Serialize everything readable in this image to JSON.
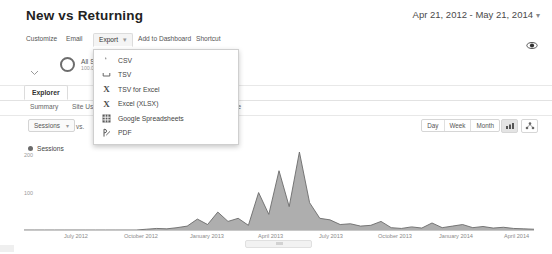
{
  "header": {
    "title": "New vs Returning",
    "date_range": "Apr 21, 2012 - May 21, 2014",
    "date_range_caret": "▾"
  },
  "toolbar": {
    "items": [
      {
        "label": "Customize",
        "active": false
      },
      {
        "label": "Email",
        "active": false
      },
      {
        "label": "Export",
        "active": true
      },
      {
        "label": "Add to Dashboard",
        "active": false
      },
      {
        "label": "Shortcut",
        "active": false
      }
    ],
    "export_caret": "▾",
    "share_icon": "share-icon"
  },
  "export_menu": {
    "items": [
      {
        "label": "CSV",
        "icon": "csv-file-icon"
      },
      {
        "label": "TSV",
        "icon": "tsv-file-icon"
      },
      {
        "label": "TSV for Excel",
        "icon": "excel-x-icon"
      },
      {
        "label": "Excel (XLSX)",
        "icon": "excel-x-icon"
      },
      {
        "label": "Google Spreadsheets",
        "icon": "grid-sheets-icon"
      },
      {
        "label": "PDF",
        "icon": "pdf-icon"
      }
    ]
  },
  "segment": {
    "chevron": "⌄",
    "name": "All Sessions",
    "percent": "100.00%"
  },
  "explorer": {
    "tab_label": "Explorer"
  },
  "subtabs": [
    {
      "label": "Summary"
    },
    {
      "label": "Site Usage"
    },
    {
      "label": "Ecommerce"
    }
  ],
  "metric_row": {
    "metric_select": "Sessions",
    "select_caret": "▾",
    "vs_label": "vs.",
    "granularity": [
      "Day",
      "Week",
      "Month"
    ],
    "view_buttons": [
      {
        "icon": "bar-chart-icon",
        "selected": true
      },
      {
        "icon": "scatter-plot-icon",
        "selected": false
      }
    ]
  },
  "legend": {
    "series_label": "Sessions",
    "color": "#6b6b6b"
  },
  "chart_data": {
    "type": "area",
    "xlabel": "",
    "ylabel": "Sessions",
    "ylim": [
      0,
      200
    ],
    "yticks": [
      100,
      200
    ],
    "grid": false,
    "legend_position": "top-left",
    "tick_labels": [
      "July 2012",
      "October 2012",
      "January 2013",
      "April 2013",
      "July 2013",
      "October 2013",
      "January 2014",
      "April 2014"
    ],
    "series": [
      {
        "name": "Sessions",
        "color": "#6b6b6b",
        "x": [
          "2012-04-21",
          "2012-05-21",
          "2012-06-21",
          "2012-07-21",
          "2012-08-21",
          "2012-09-21",
          "2012-10-21",
          "2012-11-21",
          "2012-12-21",
          "2013-01-21",
          "2013-02-21",
          "2013-03-21",
          "2013-04-21",
          "2013-05-01",
          "2013-05-11",
          "2013-05-21",
          "2013-06-01",
          "2013-06-08",
          "2013-06-15",
          "2013-06-22",
          "2013-06-29",
          "2013-07-03",
          "2013-07-06",
          "2013-07-10",
          "2013-07-13",
          "2013-07-17",
          "2013-07-20",
          "2013-07-24",
          "2013-07-28",
          "2013-08-04",
          "2013-08-11",
          "2013-08-18",
          "2013-08-25",
          "2013-09-08",
          "2013-09-22",
          "2013-10-06",
          "2013-10-20",
          "2013-11-10",
          "2013-11-24",
          "2013-12-15",
          "2014-01-05",
          "2014-01-19",
          "2014-02-02",
          "2014-02-16",
          "2014-03-02",
          "2014-03-16",
          "2014-03-30",
          "2014-04-13",
          "2014-04-27",
          "2014-05-11",
          "2014-05-21"
        ],
        "values": [
          0,
          0,
          0,
          0,
          0,
          0,
          0,
          0,
          0,
          0,
          0,
          0,
          2,
          4,
          3,
          6,
          10,
          28,
          14,
          46,
          22,
          30,
          12,
          96,
          40,
          152,
          60,
          200,
          70,
          30,
          26,
          14,
          16,
          10,
          12,
          22,
          6,
          4,
          8,
          5,
          18,
          6,
          10,
          14,
          6,
          9,
          5,
          7,
          4,
          3,
          2
        ]
      }
    ]
  }
}
